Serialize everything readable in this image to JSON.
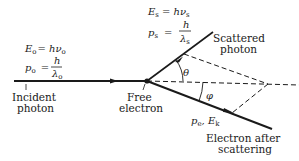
{
  "diagram": {
    "incident": {
      "energy_eq": {
        "lhs": "E",
        "lhs_sub": "o",
        "rhs": "= hν",
        "rhs_sub": "o"
      },
      "momentum_eq": {
        "lhs": "p",
        "lhs_sub": "o",
        "eq": "=",
        "num": "h",
        "den": "λ",
        "den_sub": "o"
      },
      "label_line1": "Incident",
      "label_line2": "photon"
    },
    "scattered": {
      "energy_eq": {
        "lhs": "E",
        "lhs_sub": "s",
        "rhs": "= hν",
        "rhs_sub": "s"
      },
      "momentum_eq": {
        "lhs": "p",
        "lhs_sub": "s",
        "eq": "=",
        "num": "h",
        "den": "λ",
        "den_sub": "s"
      },
      "label_line1": "Scattered",
      "label_line2": "photon"
    },
    "free_electron": {
      "label_line1": "Free",
      "label_line2": "electron"
    },
    "recoil_electron": {
      "quantities": {
        "p": "p",
        "p_sub": "e",
        "sep": ", ",
        "E": "E",
        "E_sub": "k"
      },
      "label_line1": "Electron after",
      "label_line2": "scattering"
    },
    "angles": {
      "theta": "θ",
      "phi": "φ"
    }
  }
}
